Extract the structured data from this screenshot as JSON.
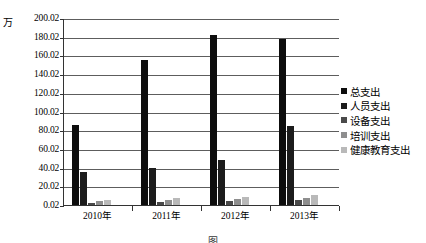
{
  "chart_data": {
    "type": "bar",
    "title": "",
    "unit_label": "万",
    "xlabel": "",
    "ylabel": "",
    "categories": [
      "2010年",
      "2011年",
      "2012年",
      "2013年"
    ],
    "ylim": [
      0.02,
      200.02
    ],
    "yticks": [
      "0.02",
      "20.02",
      "40.02",
      "60.02",
      "80.02",
      "100.02",
      "120.02",
      "140.02",
      "160.02",
      "180.02",
      "200.02"
    ],
    "grid": true,
    "legend_position": "right",
    "series": [
      {
        "name": "总支出",
        "color": "#0d0d0d",
        "values": [
          86.0,
          155.0,
          182.0,
          178.0
        ]
      },
      {
        "name": "人员支出",
        "color": "#1c1c1c",
        "values": [
          35.0,
          40.0,
          48.0,
          85.0
        ]
      },
      {
        "name": "设备支出",
        "color": "#4a4a4a",
        "values": [
          2.0,
          3.0,
          4.0,
          5.0
        ]
      },
      {
        "name": "培训支出",
        "color": "#8e8e8e",
        "values": [
          4.0,
          5.0,
          6.0,
          8.0
        ]
      },
      {
        "name": "健康教育支出",
        "color": "#b9b9b9",
        "values": [
          5.0,
          8.0,
          9.0,
          11.0
        ]
      }
    ]
  },
  "caption": "图"
}
